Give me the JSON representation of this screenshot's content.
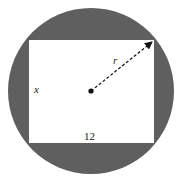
{
  "diagram": {
    "circle": {
      "cx": 91,
      "cy": 91,
      "r": 83,
      "fill": "#5f5f5f"
    },
    "rectangle": {
      "x": 29,
      "y": 40,
      "width": 125,
      "height": 103,
      "fill": "#ffffff"
    },
    "center_dot": {
      "cx": 91,
      "cy": 91
    },
    "radius_line": {
      "x1": 91,
      "y1": 91,
      "x2": 154,
      "y2": 40
    },
    "labels": {
      "side_vertical": "x",
      "side_horizontal": "12",
      "radius": "r"
    }
  }
}
